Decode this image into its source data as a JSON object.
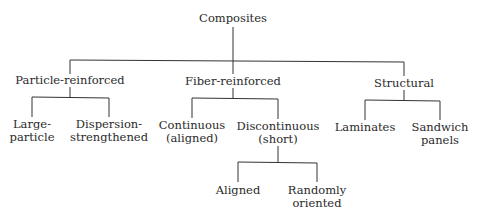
{
  "diagram": {
    "type": "tree",
    "root": {
      "label": "Composites",
      "children": [
        {
          "label": "Particle-reinforced",
          "children": [
            {
              "label_lines": [
                "Large-",
                "particle"
              ]
            },
            {
              "label_lines": [
                "Dispersion-",
                "strengthened"
              ]
            }
          ]
        },
        {
          "label": "Fiber-reinforced",
          "children": [
            {
              "label_lines": [
                "Continuous",
                "(aligned)"
              ]
            },
            {
              "label_lines": [
                "Discontinuous",
                "(short)"
              ],
              "children": [
                {
                  "label_lines": [
                    "Aligned"
                  ]
                },
                {
                  "label_lines": [
                    "Randomly",
                    "oriented"
                  ]
                }
              ]
            }
          ]
        },
        {
          "label": "Structural",
          "children": [
            {
              "label_lines": [
                "Laminates"
              ]
            },
            {
              "label_lines": [
                "Sandwich",
                "panels"
              ]
            }
          ]
        }
      ]
    },
    "line_color": "#333333"
  }
}
